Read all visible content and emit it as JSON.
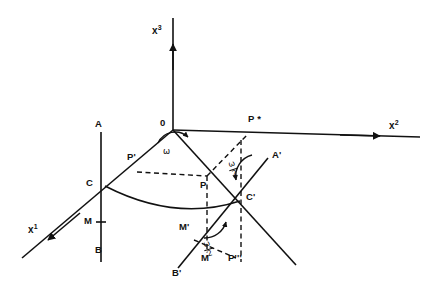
{
  "figure": {
    "kind": "geometric-line-diagram",
    "background_color": "#ffffff",
    "stroke_color": "#111111",
    "axes": [
      {
        "id": "x1",
        "base": "x",
        "exponent": "1",
        "label": "x1",
        "direction": "down-left"
      },
      {
        "id": "x2",
        "base": "x",
        "exponent": "2",
        "label": "x2",
        "direction": "right"
      },
      {
        "id": "x3",
        "base": "x",
        "exponent": "3",
        "label": "x3",
        "direction": "up"
      }
    ],
    "origin_label": "0",
    "angles": [
      {
        "id": "omega-origin",
        "symbol": "ω",
        "location": "origin"
      },
      {
        "id": "omega-half-upper",
        "numerator": "ω",
        "denominator": "2",
        "location": "above-C-prime"
      },
      {
        "id": "omega-half-lower",
        "numerator": "ω",
        "denominator": "2",
        "location": "below-C-prime"
      }
    ],
    "points": [
      {
        "id": "A",
        "label": "A"
      },
      {
        "id": "B",
        "label": "B"
      },
      {
        "id": "C",
        "label": "C"
      },
      {
        "id": "M",
        "label": "M"
      },
      {
        "id": "P-prime",
        "label": "P'"
      },
      {
        "id": "P",
        "label": "P"
      },
      {
        "id": "P-star",
        "label": "P *"
      },
      {
        "id": "A-prime",
        "label": "A'"
      },
      {
        "id": "C-prime",
        "label": "C'"
      },
      {
        "id": "M-prime",
        "label": "M'"
      },
      {
        "id": "M-lower",
        "label": "M"
      },
      {
        "id": "B-prime",
        "label": "B'"
      },
      {
        "id": "P-triple-prime",
        "label": "P'''"
      }
    ]
  }
}
